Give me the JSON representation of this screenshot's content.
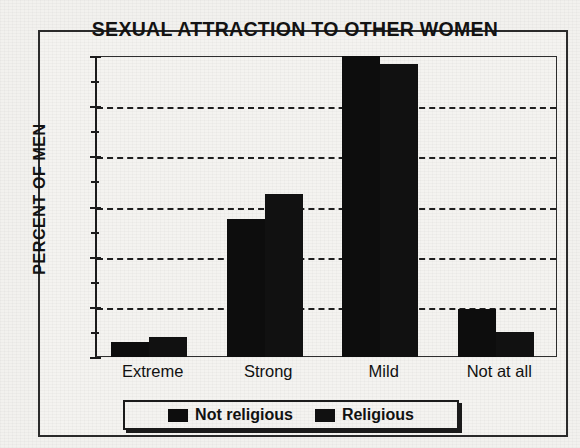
{
  "chart_data": {
    "type": "bar",
    "title": "SEXUAL ATTRACTION TO OTHER WOMEN",
    "xlabel": "",
    "ylabel": "PERCENT OF MEN",
    "categories": [
      "Extreme",
      "Strong",
      "Mild",
      "Not at all"
    ],
    "series": [
      {
        "name": "Not religious",
        "values": [
          3,
          27.5,
          60,
          9.5
        ],
        "color": "#0d0d0d"
      },
      {
        "name": "Religious",
        "values": [
          4,
          32.5,
          58.5,
          5
        ],
        "color": "#111111"
      }
    ],
    "ylim": [
      0,
      60
    ],
    "yticks": [
      0,
      10,
      20,
      30,
      40,
      50,
      60
    ],
    "yminor_ticks": [
      5,
      15,
      25,
      35,
      45,
      55
    ],
    "ytick_labels": [
      "0",
      "10",
      "20",
      "30",
      "40",
      "50",
      "60"
    ],
    "grid": "horizontal-dashed",
    "legend_position": "bottom-center"
  },
  "legend": {
    "items": [
      {
        "label": "Not religious",
        "swatch": "legend-swatch-not-religious"
      },
      {
        "label": "Religious",
        "swatch": "legend-swatch-religious"
      }
    ]
  }
}
